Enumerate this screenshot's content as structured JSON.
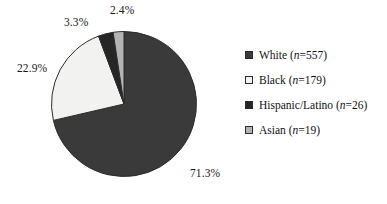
{
  "chart_data": {
    "type": "pie",
    "title": "",
    "categories": [
      "White",
      "Black",
      "Hispanic/Latino",
      "Asian"
    ],
    "values": [
      71.3,
      22.9,
      3.3,
      2.4
    ],
    "counts": [
      557,
      179,
      26,
      19
    ],
    "value_unit": "%",
    "start_angle_deg": 0,
    "direction": "clockwise",
    "legend_position": "right",
    "grid": false,
    "slices": [
      {
        "name": "White",
        "percent": 71.3,
        "percent_label": "71.3%",
        "count": 557,
        "color": "#3a3a3a",
        "legend_label_prefix": "White (",
        "legend_label_n": "n",
        "legend_label_suffix": "=557)"
      },
      {
        "name": "Black",
        "percent": 22.9,
        "percent_label": "22.9%",
        "count": 179,
        "color": "#f2f2f0",
        "legend_label_prefix": "Black (",
        "legend_label_n": "n",
        "legend_label_suffix": "=179)"
      },
      {
        "name": "Hispanic/Latino",
        "percent": 3.3,
        "percent_label": "3.3%",
        "count": 26,
        "color": "#262626",
        "legend_label_prefix": "Hispanic/Latino (",
        "legend_label_n": "n",
        "legend_label_suffix": "=26)"
      },
      {
        "name": "Asian",
        "percent": 2.4,
        "percent_label": "2.4%",
        "count": 19,
        "color": "#b3b3b3",
        "legend_label_prefix": "Asian (",
        "legend_label_n": "n",
        "legend_label_suffix": "=19)"
      }
    ]
  },
  "colors": {
    "background": "#ffffff",
    "outline": "#2b2b2b",
    "text": "#111111"
  },
  "labels": {
    "white_pct": "71.3%",
    "black_pct": "22.9%",
    "hispanic_pct": "3.3%",
    "asian_pct": "2.4%"
  },
  "legend": {
    "rows": [
      {
        "swatch": "legend-swatch-white",
        "prefix": "White (",
        "n": "n",
        "suffix": "=557)"
      },
      {
        "swatch": "legend-swatch-black",
        "prefix": "Black (",
        "n": "n",
        "suffix": "=179)"
      },
      {
        "swatch": "legend-swatch-hispanic",
        "prefix": "Hispanic/Latino (",
        "n": "n",
        "suffix": "=26)"
      },
      {
        "swatch": "legend-swatch-asian",
        "prefix": "Asian (",
        "n": "n",
        "suffix": "=19)"
      }
    ]
  }
}
